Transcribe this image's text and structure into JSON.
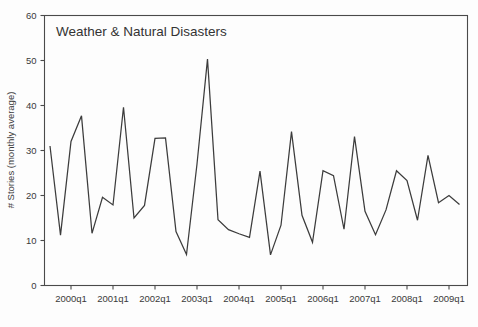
{
  "chart_data": {
    "type": "line",
    "title": "Weather & Natural Disasters",
    "xlabel": "",
    "ylabel": "# Stories (monthly average)",
    "ylim": [
      0,
      60
    ],
    "y_ticks": [
      0,
      10,
      20,
      30,
      40,
      50,
      60
    ],
    "x_tick_labels": [
      "2000q1",
      "2001q1",
      "2002q1",
      "2003q1",
      "2004q1",
      "2005q1",
      "2006q1",
      "2007q1",
      "2008q1",
      "2009q1"
    ],
    "grid": false,
    "legend": "none",
    "x": [
      "1999q3",
      "1999q4",
      "2000q1",
      "2000q2",
      "2000q3",
      "2000q4",
      "2001q1",
      "2001q2",
      "2001q3",
      "2001q4",
      "2002q1",
      "2002q2",
      "2002q3",
      "2002q4",
      "2003q1",
      "2003q2",
      "2003q3",
      "2003q4",
      "2004q1",
      "2004q2",
      "2004q3",
      "2004q4",
      "2005q1",
      "2005q2",
      "2005q3",
      "2005q4",
      "2006q1",
      "2006q2",
      "2006q3",
      "2006q4",
      "2007q1",
      "2007q2",
      "2007q3",
      "2007q4",
      "2008q1",
      "2008q2",
      "2008q3",
      "2008q4",
      "2009q1",
      "2009q2"
    ],
    "series": [
      {
        "name": "# Stories (monthly average)",
        "values": [
          31.0,
          11.2,
          32.0,
          37.7,
          11.6,
          19.6,
          17.9,
          39.6,
          15.0,
          17.8,
          32.7,
          32.8,
          12.0,
          6.9,
          27.0,
          50.3,
          14.6,
          12.4,
          11.5,
          10.7,
          25.4,
          6.8,
          13.4,
          34.2,
          15.6,
          9.6,
          25.5,
          24.4,
          12.5,
          33.1,
          16.5,
          11.3,
          16.8,
          25.5,
          23.3,
          14.5,
          28.9,
          18.4,
          20.0,
          18.0
        ]
      }
    ]
  },
  "figure": {
    "title": "Weather & Natural Disasters",
    "y_axis_title": "# Stories (monthly average)"
  }
}
